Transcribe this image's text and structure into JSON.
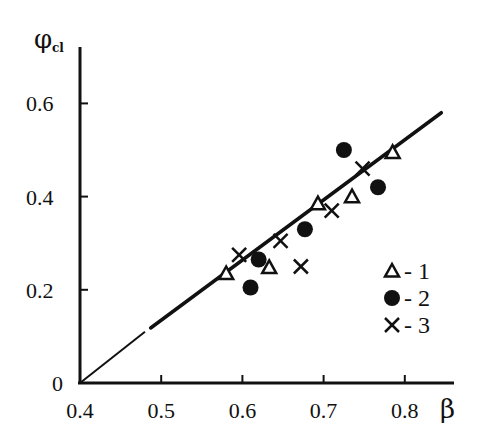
{
  "chart_data": {
    "type": "scatter",
    "title": "",
    "xlabel": "β",
    "ylabel": "φcl",
    "ylabel_main": "φ",
    "ylabel_sub": "cl",
    "xlim": [
      0.4,
      0.85
    ],
    "ylim": [
      0,
      0.62
    ],
    "grid": false,
    "legend_position": "right-lower-inside",
    "x_ticks": [
      0.4,
      0.5,
      0.6,
      0.7,
      0.8
    ],
    "x_tick_labels": [
      "0.4",
      "0.5",
      "0.6",
      "0.7",
      "0.8"
    ],
    "y_ticks": [
      0,
      0.2,
      0.4,
      0.6
    ],
    "y_tick_labels": [
      "0",
      "0.2",
      "0.4",
      "0.6"
    ],
    "series": [
      {
        "name": "1",
        "marker": "triangle-open",
        "points": [
          [
            0.58,
            0.235
          ],
          [
            0.633,
            0.248
          ],
          [
            0.693,
            0.385
          ],
          [
            0.735,
            0.4
          ],
          [
            0.785,
            0.495
          ]
        ]
      },
      {
        "name": "2",
        "marker": "circle-filled",
        "points": [
          [
            0.61,
            0.205
          ],
          [
            0.62,
            0.265
          ],
          [
            0.677,
            0.33
          ],
          [
            0.725,
            0.5
          ],
          [
            0.767,
            0.42
          ]
        ]
      },
      {
        "name": "3",
        "marker": "cross",
        "points": [
          [
            0.596,
            0.275
          ],
          [
            0.647,
            0.305
          ],
          [
            0.672,
            0.25
          ],
          [
            0.71,
            0.37
          ],
          [
            0.748,
            0.46
          ]
        ]
      }
    ],
    "fit_line": {
      "style": "solid with dashed extrapolation to origin",
      "dashed_from": [
        0.4,
        0.0
      ],
      "dashed_to": [
        0.48,
        0.11
      ],
      "solid_from": [
        0.487,
        0.118
      ],
      "solid_to": [
        0.845,
        0.58
      ]
    },
    "legend": [
      {
        "marker": "triangle-open",
        "label": "- 1"
      },
      {
        "marker": "circle-filled",
        "label": "- 2"
      },
      {
        "marker": "cross",
        "label": "- 3"
      }
    ]
  }
}
